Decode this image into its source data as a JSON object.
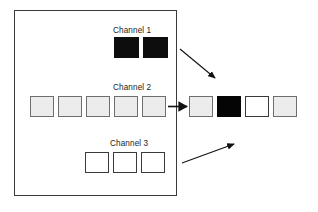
{
  "figure": {
    "background_color": "#ffffff",
    "frame": {
      "name": "input-volume-frame",
      "x": 14,
      "y": 10,
      "width": 163,
      "height": 186,
      "stroke": "#3a3a3a"
    }
  },
  "channels": [
    {
      "id": "channel-1",
      "label": "Channel 1",
      "label_x": 113,
      "label_y": 26,
      "row_y": 37,
      "cell_width": 25,
      "cell_height": 21,
      "cells": [
        {
          "x": 114,
          "fill": "dark",
          "color": "#0d0d0d"
        },
        {
          "x": 143,
          "fill": "dark",
          "color": "#0d0d0d"
        }
      ]
    },
    {
      "id": "channel-2",
      "label": "Channel 2",
      "label_x": 113,
      "label_y": 83,
      "row_y": 96,
      "cell_width": 24,
      "cell_height": 21,
      "cells": [
        {
          "x": 30,
          "fill": "gray",
          "color": "#ececed"
        },
        {
          "x": 58,
          "fill": "gray",
          "color": "#ececed"
        },
        {
          "x": 86,
          "fill": "gray",
          "color": "#ececed"
        },
        {
          "x": 114,
          "fill": "gray",
          "color": "#ececed"
        },
        {
          "x": 142,
          "fill": "gray",
          "color": "#ececed"
        }
      ]
    },
    {
      "id": "channel-3",
      "label": "Channel 3",
      "label_x": 110,
      "label_y": 139,
      "row_y": 152,
      "cell_width": 24,
      "cell_height": 21,
      "cells": [
        {
          "x": 85,
          "fill": "white",
          "color": "#ffffff"
        },
        {
          "x": 113,
          "fill": "white",
          "color": "#ffffff"
        },
        {
          "x": 141,
          "fill": "white",
          "color": "#ffffff"
        }
      ]
    }
  ],
  "output_row": {
    "id": "output-row",
    "row_y": 96,
    "cell_width": 24,
    "cell_height": 21,
    "cells": [
      {
        "x": 189,
        "fill": "gray",
        "color": "#ececed"
      },
      {
        "x": 217,
        "fill": "black",
        "color": "#050505"
      },
      {
        "x": 245,
        "fill": "white",
        "color": "#ffffff"
      },
      {
        "x": 273,
        "fill": "gray",
        "color": "#ececed"
      }
    ]
  },
  "arrows": [
    {
      "id": "arrow-channel-1-to-output",
      "name": "arrow-down-right",
      "x1": 180,
      "y1": 49,
      "x2": 216,
      "y2": 79,
      "color": "#111111"
    },
    {
      "id": "arrow-channel-2-to-output",
      "name": "arrow-right",
      "x1": 168,
      "y1": 106,
      "x2": 188,
      "y2": 106,
      "color": "#111111"
    },
    {
      "id": "arrow-channel-3-to-output",
      "name": "arrow-up-right",
      "x1": 182,
      "y1": 163,
      "x2": 235,
      "y2": 143,
      "color": "#111111"
    }
  ]
}
